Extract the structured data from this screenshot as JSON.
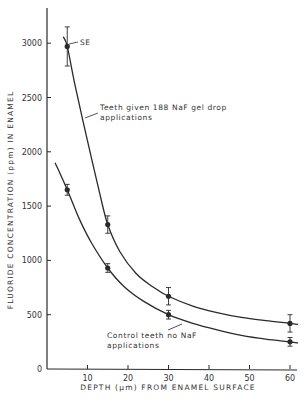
{
  "chart_data": {
    "type": "line",
    "title": "",
    "xlabel": "DEPTH (µm) FROM ENAMEL SURFACE",
    "ylabel": "FLUORIDE CONCENTRATION (ppm) IN ENAMEL",
    "xlim": [
      0,
      62
    ],
    "ylim": [
      0,
      3300
    ],
    "x_ticks": [
      10,
      20,
      30,
      40,
      50,
      60
    ],
    "y_ticks": [
      0,
      500,
      1000,
      1500,
      2000,
      2500,
      3000
    ],
    "grid": false,
    "series": [
      {
        "name": "Teeth given 188 NaF gel drop applications",
        "x": [
          5,
          15,
          30,
          60
        ],
        "values": [
          2970,
          1330,
          670,
          420
        ],
        "error": [
          180,
          80,
          80,
          80
        ],
        "curve": [
          [
            4,
            3060
          ],
          [
            5,
            2970
          ],
          [
            7,
            2600
          ],
          [
            10,
            2100
          ],
          [
            13,
            1620
          ],
          [
            15,
            1330
          ],
          [
            18,
            1080
          ],
          [
            22,
            880
          ],
          [
            26,
            760
          ],
          [
            30,
            670
          ],
          [
            36,
            580
          ],
          [
            42,
            520
          ],
          [
            48,
            475
          ],
          [
            54,
            445
          ],
          [
            60,
            420
          ],
          [
            62,
            410
          ]
        ]
      },
      {
        "name": "Control teeth no NaF applications",
        "x": [
          5,
          15,
          30,
          60
        ],
        "values": [
          1650,
          930,
          500,
          250
        ],
        "error": [
          50,
          40,
          40,
          40
        ],
        "curve": [
          [
            2,
            1900
          ],
          [
            5,
            1650
          ],
          [
            8,
            1380
          ],
          [
            11,
            1160
          ],
          [
            15,
            930
          ],
          [
            19,
            760
          ],
          [
            24,
            620
          ],
          [
            30,
            500
          ],
          [
            36,
            420
          ],
          [
            42,
            360
          ],
          [
            48,
            310
          ],
          [
            54,
            275
          ],
          [
            60,
            250
          ],
          [
            62,
            240
          ]
        ]
      }
    ],
    "annotations": [
      {
        "text": "SE",
        "x": 5,
        "y": 2970
      },
      {
        "text": "Teeth given 188 NaF gel drop",
        "line2": "applications"
      },
      {
        "text": "Control teeth no NaF",
        "line2": "applications"
      }
    ]
  },
  "labels": {
    "se": "SE",
    "upper_l1": "Teeth  given  188  NaF gel drop",
    "upper_l2": "applications",
    "lower_l1": "Control  teeth  no  NaF",
    "lower_l2": "applications",
    "xlabel": "DEPTH (µm)  FROM  ENAMEL  SURFACE",
    "ylabel": "FLUORIDE   CONCENTRATION   (ppm)   IN   ENAMEL"
  },
  "colors": {
    "ink": "#2a2a2a",
    "background": "#ffffff"
  }
}
